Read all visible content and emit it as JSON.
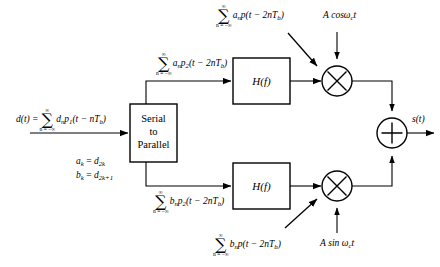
{
  "diagram": {
    "stroke_color": "#000000",
    "background_color": "#ffffff"
  },
  "blocks": {
    "serial_to_parallel": {
      "line1": "Serial",
      "line2": "to",
      "line3": "Parallel"
    },
    "filter_upper": "H(f)",
    "filter_lower": "H(f)"
  },
  "nodes": {
    "multiplier_upper": "×",
    "multiplier_lower": "×",
    "adder": "+"
  },
  "labels": {
    "input_signal": {
      "lhs": "d(t) =",
      "sum_upper": "∞",
      "sum_lower": "n = −∞",
      "body_pre": "d",
      "body_sub1": "n",
      "body_p": "p",
      "body_sub2": "1",
      "body_arg": "(t − nT",
      "body_sub3": "b",
      "body_end": ")"
    },
    "mapping_a": {
      "lhs": "a",
      "lhs_sub": "k",
      "eq": "=",
      "rhs": "d",
      "rhs_sub": "2k"
    },
    "mapping_b": {
      "lhs": "b",
      "lhs_sub": "k",
      "eq": "=",
      "rhs": "d",
      "rhs_sub": "2k+1"
    },
    "upper_branch_signal": {
      "sum_upper": "∞",
      "sum_lower": "n = −∞",
      "coef": "a",
      "coef_sub": "n",
      "pulse": "p",
      "pulse_sub": "2",
      "arg": "(t − 2nT",
      "arg_sub": "b",
      "arg_end": ")"
    },
    "lower_branch_signal": {
      "sum_upper": "∞",
      "sum_lower": "n = −∞",
      "coef": "b",
      "coef_sub": "n",
      "pulse": "p",
      "pulse_sub": "2",
      "arg": "(t − 2nT",
      "arg_sub": "b",
      "arg_end": ")"
    },
    "upper_filtered_signal": {
      "sum_upper": "∞",
      "sum_lower": "n = −∞",
      "coef": "a",
      "coef_sub": "n",
      "pulse": "p",
      "arg": "(t − 2nT",
      "arg_sub": "b",
      "arg_end": ")"
    },
    "lower_filtered_signal": {
      "sum_upper": "∞",
      "sum_lower": "n = −∞",
      "coef": "b",
      "coef_sub": "n",
      "pulse": "p",
      "arg": "(t − 2nT",
      "arg_sub": "b",
      "arg_end": ")"
    },
    "carrier_cos": {
      "amp": "A",
      "fn": "cos",
      "omega": "ω",
      "omega_sub": "c",
      "time": "t"
    },
    "carrier_sin": {
      "amp": "A",
      "fn": "sin",
      "omega": "ω",
      "omega_sub": "c",
      "time": "t"
    },
    "output_signal": "s(t)"
  }
}
